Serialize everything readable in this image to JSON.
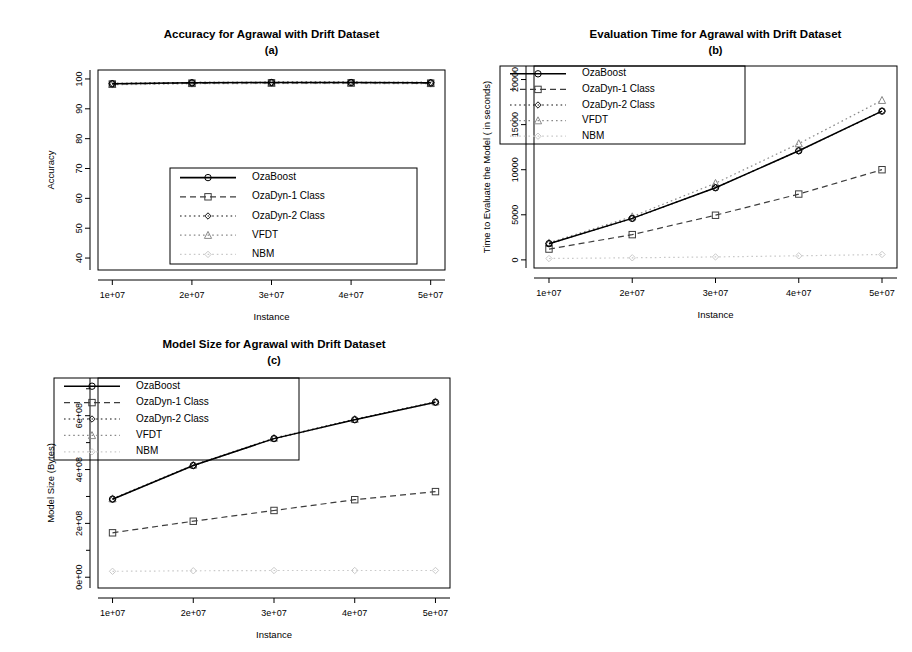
{
  "figure": {
    "panels": [
      "a",
      "b",
      "c"
    ],
    "series_names": [
      "OzaBoost",
      "OzaDyn-1 Class",
      "OzaDyn-2 Class",
      "VFDT",
      "NBM"
    ],
    "x_label": "Instance",
    "x_tick_labels": [
      "1e+07",
      "2e+07",
      "3e+07",
      "4e+07",
      "5e+07"
    ],
    "colors": {
      "ozaboost": "#000000",
      "ozadyn1": "#3d3d3d",
      "ozadyn2": "#111111",
      "vfdt": "#8a8a8a",
      "nbm": "#c9c9c9",
      "frame": "#000000",
      "background": "#ffffff"
    }
  },
  "chart_data": [
    {
      "id": "a",
      "type": "line",
      "title": "Accuracy for Agrawal with Drift Dataset",
      "subtitle": "(a)",
      "xlabel": "Instance",
      "ylabel": "Accuracy",
      "x": [
        10000000,
        20000000,
        30000000,
        40000000,
        50000000
      ],
      "x_tick_labels": [
        "1e+07",
        "2e+07",
        "3e+07",
        "4e+07",
        "5e+07"
      ],
      "y_ticks": [
        40,
        50,
        60,
        70,
        80,
        90,
        100
      ],
      "y_tick_labels": [
        "40",
        "50",
        "60",
        "70",
        "80",
        "90",
        "100"
      ],
      "ylim": [
        36,
        103
      ],
      "grid": false,
      "legend_position": "bottom-center",
      "series": [
        {
          "name": "OzaBoost",
          "values": [
            98.4,
            98.7,
            98.8,
            98.8,
            98.7
          ],
          "style": "solid",
          "marker": "circle",
          "color": "#000000"
        },
        {
          "name": "OzaDyn-1 Class",
          "values": [
            98.3,
            98.6,
            98.7,
            98.7,
            98.6
          ],
          "style": "dashed",
          "marker": "square",
          "color": "#3d3d3d"
        },
        {
          "name": "OzaDyn-2 Class",
          "values": [
            98.5,
            98.8,
            98.9,
            98.9,
            98.8
          ],
          "style": "dotted",
          "marker": "diamond",
          "color": "#111111"
        },
        {
          "name": "VFDT",
          "values": [
            98.2,
            98.5,
            98.6,
            98.6,
            98.5
          ],
          "style": "dotted",
          "marker": "triangle",
          "color": "#8a8a8a"
        },
        {
          "name": "NBM",
          "values": [
            98.0,
            98.3,
            98.4,
            98.4,
            98.3
          ],
          "style": "dotted",
          "marker": "diamond",
          "color": "#c9c9c9"
        }
      ]
    },
    {
      "id": "b",
      "type": "line",
      "title": "Evaluation Time for Agrawal with Drift Dataset",
      "subtitle": "(b)",
      "xlabel": "Instance",
      "ylabel": "Time to Evaluate the Model ( in seconds)",
      "x": [
        10000000,
        20000000,
        30000000,
        40000000,
        50000000
      ],
      "x_tick_labels": [
        "1e+07",
        "2e+07",
        "3e+07",
        "4e+07",
        "5e+07"
      ],
      "y_ticks": [
        0,
        5000,
        10000,
        15000,
        20000
      ],
      "y_tick_labels": [
        "0",
        "5000",
        "10000",
        "15000",
        "20000"
      ],
      "ylim": [
        -900,
        21500
      ],
      "grid": false,
      "legend_position": "top-left",
      "series": [
        {
          "name": "OzaBoost",
          "values": [
            1800,
            4600,
            8000,
            12100,
            16500
          ],
          "style": "solid",
          "marker": "circle",
          "color": "#000000"
        },
        {
          "name": "OzaDyn-1 Class",
          "values": [
            1200,
            2800,
            4950,
            7300,
            10000
          ],
          "style": "dashed",
          "marker": "square",
          "color": "#3d3d3d"
        },
        {
          "name": "OzaDyn-2 Class",
          "values": [
            1800,
            4600,
            8000,
            12100,
            16500
          ],
          "style": "dotted",
          "marker": "diamond",
          "color": "#111111"
        },
        {
          "name": "VFDT",
          "values": [
            1900,
            4800,
            8500,
            12900,
            17700
          ],
          "style": "dotted",
          "marker": "triangle",
          "color": "#8a8a8a"
        },
        {
          "name": "NBM",
          "values": [
            150,
            230,
            330,
            450,
            600
          ],
          "style": "dotted",
          "marker": "diamond",
          "color": "#c9c9c9"
        }
      ]
    },
    {
      "id": "c",
      "type": "line",
      "title": "Model Size for Agrawal with Drift Dataset",
      "subtitle": "(c)",
      "xlabel": "Instance",
      "ylabel": "Model Size (Bytes)",
      "x": [
        10000000,
        20000000,
        30000000,
        40000000,
        50000000
      ],
      "x_tick_labels": [
        "1e+07",
        "2e+07",
        "3e+07",
        "4e+07",
        "5e+07"
      ],
      "y_ticks": [
        0,
        200000000,
        400000000,
        600000000
      ],
      "y_tick_labels": [
        "0e+00",
        "2e+08",
        "4e+08",
        "6e+08"
      ],
      "y_minor_ticks": [
        100000000,
        300000000,
        500000000,
        700000000
      ],
      "ylim": [
        -40000000,
        740000000
      ],
      "grid": false,
      "legend_position": "top-left",
      "series": [
        {
          "name": "OzaBoost",
          "values": [
            290000000,
            415000000,
            515000000,
            585000000,
            650000000
          ],
          "style": "solid",
          "marker": "circle",
          "color": "#000000"
        },
        {
          "name": "OzaDyn-1 Class",
          "values": [
            165000000,
            208000000,
            248000000,
            288000000,
            318000000
          ],
          "style": "dashed",
          "marker": "square",
          "color": "#3d3d3d"
        },
        {
          "name": "OzaDyn-2 Class",
          "values": [
            290000000,
            415000000,
            515000000,
            585000000,
            650000000
          ],
          "style": "dotted",
          "marker": "diamond",
          "color": "#111111"
        },
        {
          "name": "VFDT",
          "values": [
            292000000,
            417000000,
            517000000,
            587000000,
            652000000
          ],
          "style": "dotted",
          "marker": "triangle",
          "color": "#8a8a8a"
        },
        {
          "name": "NBM",
          "values": [
            22000000,
            24000000,
            25000000,
            25000000,
            25000000
          ],
          "style": "dotted",
          "marker": "diamond",
          "color": "#c9c9c9"
        }
      ]
    }
  ]
}
